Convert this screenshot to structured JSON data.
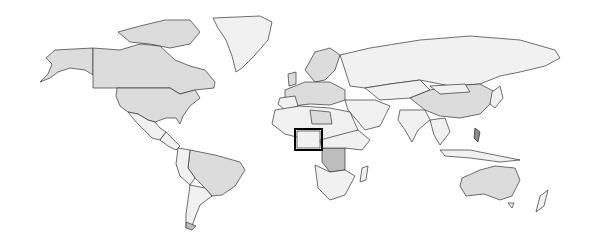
{
  "map": {
    "type": "world-choropleth",
    "colors": {
      "ocean": "#ffffff",
      "land_light": "#f1f1f1",
      "land_mid": "#dcdcdc",
      "land_dark": "#bdbdbd",
      "land_darker": "#8a8a8a",
      "border": "#333333",
      "highlight_box": "#000000"
    },
    "highlight": {
      "region": "Nigeria",
      "box": {
        "x": 295,
        "y": 129,
        "width": 27,
        "height": 21
      }
    }
  }
}
